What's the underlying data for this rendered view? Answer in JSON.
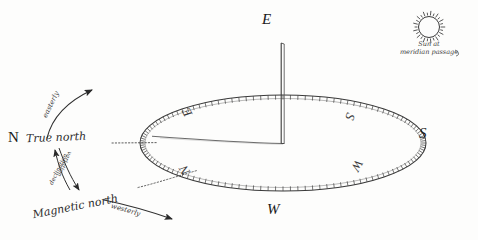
{
  "figure": {
    "kind": "hand-drawn-navigation-diagram",
    "background_color": "#fdfdfc",
    "ink_color": "#2a2a2a"
  },
  "outer_cardinals": [
    {
      "id": "outer-east",
      "label": "E",
      "x": 264,
      "y": 14
    },
    {
      "id": "outer-south",
      "label": "S",
      "x": 421,
      "y": 128
    },
    {
      "id": "outer-west",
      "label": "W",
      "x": 270,
      "y": 205
    },
    {
      "id": "outer-north",
      "label": "N",
      "x": 10,
      "y": 132
    }
  ],
  "dial": {
    "name": "compass-dial",
    "center_x": 283,
    "center_y": 143,
    "radius_x": 143,
    "radius_y": 48,
    "tick_count": 120,
    "letters": [
      {
        "id": "dial-east",
        "label": "E",
        "x": 186,
        "y": 113,
        "rotation": -118
      },
      {
        "id": "dial-south",
        "label": "S",
        "x": 349,
        "y": 116,
        "rotation": -250
      },
      {
        "id": "dial-west",
        "label": "W",
        "x": 355,
        "y": 165,
        "rotation": -242
      },
      {
        "id": "dial-north",
        "label": "N",
        "x": 182,
        "y": 170,
        "rotation": -120
      }
    ]
  },
  "gnomon": {
    "name": "gnomon-style",
    "base_x": 283,
    "base_y": 143,
    "top_y": 43
  },
  "shadow_line": {
    "name": "shadow-line",
    "from_x": 283,
    "from_y": 143,
    "to_x": 152,
    "to_y": 136
  },
  "labels": {
    "true_north_prefix": "N",
    "true_north": "True north",
    "magnetic_north": "Magnetic north",
    "easterly": "easterly",
    "westerly": "westerly",
    "declination": "declination",
    "variation": "variation"
  },
  "sun": {
    "name": "sun-at-meridian",
    "caption_line1": "Sun at",
    "caption_line2": "meridian passage",
    "center_x": 429,
    "center_y": 27,
    "radius": 11,
    "ray_count": 26
  },
  "dotted_guides": [
    {
      "id": "true-north-guide",
      "from_x": 110,
      "from_y": 143,
      "to_x": 158,
      "to_y": 143
    },
    {
      "id": "magnetic-north-guide",
      "from_x": 140,
      "from_y": 186,
      "to_x": 196,
      "to_y": 171
    }
  ],
  "arrows": [
    {
      "id": "easterly-arrow",
      "label": "easterly"
    },
    {
      "id": "westerly-arrow",
      "label": "westerly"
    },
    {
      "id": "declination-arrow",
      "label": "declination"
    },
    {
      "id": "variation-arrow",
      "label": "variation"
    }
  ]
}
